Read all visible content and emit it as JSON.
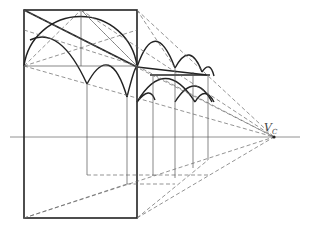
{
  "diagram": {
    "vanishing_point": {
      "label": "V",
      "subscript": "C",
      "x": 274,
      "y": 137
    },
    "horizon_line": {
      "y": 137,
      "x1": 10,
      "x2": 300
    },
    "front_square": {
      "x1": 24,
      "y1": 10,
      "x2": 137,
      "y2": 218
    },
    "colors": {
      "line": "#222222",
      "construction": "#666666",
      "background": "#ffffff"
    }
  }
}
